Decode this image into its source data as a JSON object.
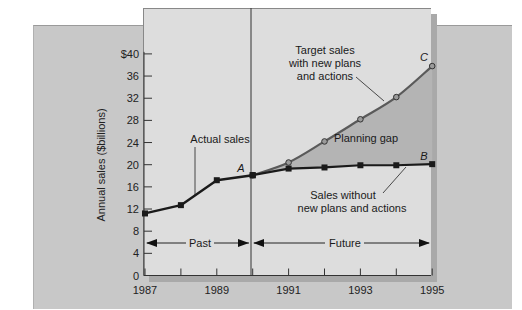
{
  "chart_data": {
    "type": "line",
    "title": "",
    "xlabel": "",
    "ylabel": "Annual sales ($billions)",
    "ylim": [
      0,
      40
    ],
    "xlim": [
      1987,
      1995
    ],
    "grid": false,
    "y_ticks": [
      "0",
      "4",
      "8",
      "12",
      "16",
      "20",
      "24",
      "28",
      "32",
      "36",
      "$40"
    ],
    "x_ticks": [
      "1987",
      "1989",
      "1991",
      "1993",
      "1995"
    ],
    "series": [
      {
        "name": "Actual sales",
        "marker": "square",
        "x": [
          1987,
          1988,
          1989,
          1990
        ],
        "values": [
          11.2,
          12.7,
          17.2,
          18.1
        ]
      },
      {
        "name": "Sales without new plans and actions",
        "marker": "square",
        "end_label": "B",
        "x": [
          1990,
          1991,
          1992,
          1993,
          1994,
          1995
        ],
        "values": [
          18.1,
          19.3,
          19.5,
          19.9,
          19.9,
          20.1
        ]
      },
      {
        "name": "Target sales with new plans and actions",
        "marker": "circle",
        "end_label": "C",
        "x": [
          1990,
          1991,
          1992,
          1993,
          1994,
          1995
        ],
        "values": [
          18.1,
          20.4,
          24.2,
          28.2,
          32.2,
          37.8
        ]
      }
    ],
    "annotations": [
      {
        "text": "A",
        "x": 1990,
        "y": 18.1
      },
      {
        "text": "Planning gap",
        "region": "between target and no-plan lines 1990-1995"
      },
      {
        "text": "Past",
        "span": [
          1987,
          1990
        ]
      },
      {
        "text": "Future",
        "span": [
          1990,
          1995
        ]
      }
    ],
    "divider_x": 1990
  },
  "labels": {
    "ylabel": "Annual sales ($billions)",
    "actual": "Actual sales",
    "target_1": "Target sales",
    "target_2": "with new plans",
    "target_3": "and actions",
    "without_1": "Sales without",
    "without_2": "new plans and actions",
    "gap": "Planning gap",
    "past": "Past",
    "future": "Future",
    "point_a": "A",
    "point_b": "B",
    "point_c": "C"
  },
  "colors": {
    "target_line": "#5a5a5a",
    "actual_line": "#1a1a1a",
    "gap_fill": "#b4b4b4",
    "inner_panel": "#dddddd",
    "outer_panel": "#c8c8c8"
  }
}
